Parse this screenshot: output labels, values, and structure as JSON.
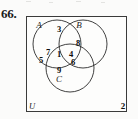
{
  "figure": {
    "problem_number": "66.",
    "universe_label": "U",
    "corner_number": "2",
    "type": "three-set-venn-diagram",
    "accent_color": "#2b2b2b",
    "background_color": "#fbfbfa"
  },
  "sets": [
    {
      "label": "A",
      "x": 39,
      "y": 25
    },
    {
      "label": "B",
      "x": 79,
      "y": 25
    },
    {
      "label": "C",
      "x": 59,
      "y": 79
    }
  ],
  "regions": [
    {
      "id": "A-and-B-only",
      "number": "3",
      "x": 59,
      "y": 29
    },
    {
      "id": "B-only-inner-edge",
      "number": "8",
      "x": 78,
      "y": 43
    },
    {
      "id": "A-and-C-only",
      "number": "7",
      "x": 48,
      "y": 52
    },
    {
      "id": "A-and-B-and-C",
      "number": "1",
      "x": 59,
      "y": 54
    },
    {
      "id": "B-and-C-only",
      "number": "4",
      "x": 71,
      "y": 54
    },
    {
      "id": "A-only",
      "number": "5",
      "x": 41,
      "y": 60
    },
    {
      "id": "B-only-lower",
      "number": "6",
      "x": 73,
      "y": 62
    },
    {
      "id": "C-only",
      "number": "9",
      "x": 59,
      "y": 70
    }
  ],
  "geometry": {
    "box": {
      "x": 26,
      "y": 16,
      "width": 101,
      "height": 96
    },
    "circles": [
      {
        "set": "A",
        "cx": 31,
        "cy": 28,
        "r": 24
      },
      {
        "set": "B",
        "cx": 57,
        "cy": 28,
        "r": 24
      },
      {
        "set": "C",
        "cx": 44,
        "cy": 52,
        "r": 24
      }
    ]
  }
}
